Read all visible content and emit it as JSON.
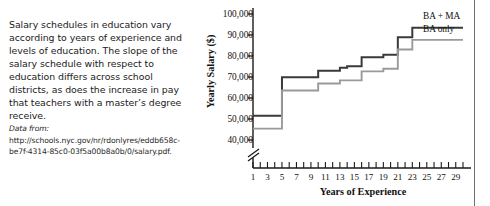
{
  "caption": {
    "body": "Salary schedules in education vary according to years of experience and levels of education. The slope of the salary schedule with respect to education differs across school districts, as does the increase in pay that teachers with a master’s degree receive.",
    "source_lead": "Data from:",
    "source_url": "http://schools.nyc.gov/nr/rdonlyres/eddb658c-be7f-4314-85c0-03f5a00b8a0b/0/salary.pdf."
  },
  "colors": {
    "ba_ma": "#3a3a3a",
    "ba_only": "#9a9a9a",
    "axis": "#1a1a1a",
    "rule": "#6f6f6f",
    "text": "#1b1b1b"
  },
  "chart_data": {
    "type": "line",
    "title": "",
    "xlabel": "Years of Experience",
    "ylabel": "Yearly Salary ($)",
    "xlim": [
      1,
      30
    ],
    "ylim": [
      38000,
      100000
    ],
    "y_axis_break": true,
    "y_break_symbol": "//",
    "grid": false,
    "legend_position": "inline-right",
    "yticks": [
      40000,
      50000,
      60000,
      70000,
      80000,
      90000,
      100000
    ],
    "ytick_labels": [
      "40,000",
      "50,000",
      "60,000",
      "70,000",
      "80,000",
      "90,000",
      "100,000"
    ],
    "xticks": [
      1,
      2,
      3,
      4,
      5,
      6,
      7,
      8,
      9,
      10,
      11,
      12,
      13,
      14,
      15,
      16,
      17,
      18,
      19,
      20,
      21,
      22,
      23,
      24,
      25,
      26,
      27,
      28,
      29,
      30
    ],
    "xtick_labels_shown": [
      "1",
      "3",
      "5",
      "7",
      "9",
      "11",
      "13",
      "15",
      "17",
      "19",
      "21",
      "23",
      "25",
      "27",
      "29"
    ],
    "x": [
      1,
      2,
      3,
      4,
      5,
      6,
      7,
      8,
      9,
      10,
      11,
      12,
      13,
      14,
      15,
      16,
      17,
      18,
      19,
      20,
      21,
      22,
      23,
      24,
      25,
      26,
      27,
      28,
      29,
      30
    ],
    "series": [
      {
        "name": "BA + MA",
        "color": "#3a3a3a",
        "values": [
          51500,
          51500,
          51500,
          51500,
          69900,
          69900,
          69900,
          69900,
          69900,
          73000,
          73000,
          73000,
          74400,
          75100,
          75100,
          79400,
          79400,
          79400,
          80600,
          80600,
          88900,
          88900,
          93500,
          93500,
          93500,
          93500,
          93500,
          93500,
          93500,
          93500
        ]
      },
      {
        "name": "BA only",
        "color": "#9a9a9a",
        "values": [
          45400,
          45400,
          45400,
          45400,
          63600,
          63600,
          63600,
          63600,
          63600,
          66900,
          66900,
          66900,
          68400,
          68400,
          68400,
          72700,
          72700,
          72700,
          73900,
          73900,
          83100,
          83100,
          87700,
          87700,
          87700,
          87700,
          87700,
          87700,
          87700,
          87700
        ]
      }
    ],
    "annotations": [
      {
        "text": "BA + MA",
        "series": "BA + MA"
      },
      {
        "text": "BA only",
        "series": "BA only"
      }
    ]
  }
}
